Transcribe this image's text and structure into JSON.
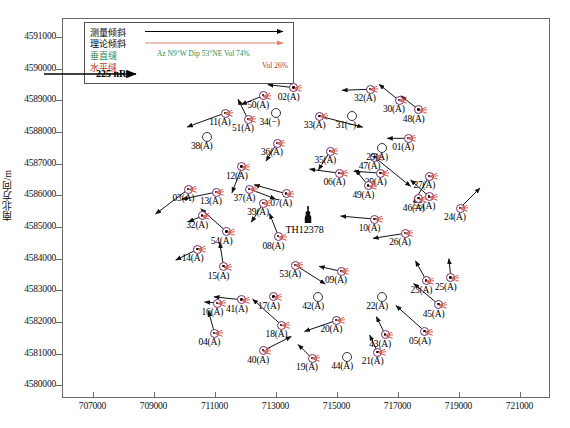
{
  "axes": {
    "ylabel": "南北方向/m",
    "xlabel": "",
    "xticks": [
      "707000",
      "709000",
      "711000",
      "713000",
      "715000",
      "717000",
      "719000",
      "721000"
    ],
    "yticks": [
      "4591000",
      "4590000",
      "4589000",
      "4588000",
      "4587000",
      "4586000",
      "4585000",
      "4584000",
      "4583000",
      "4582000",
      "4581000",
      "4580000"
    ],
    "xlim": [
      706000,
      722000
    ],
    "ylim": [
      4579600,
      4591600
    ]
  },
  "legend": {
    "measured_tilt": "测量倾斜",
    "theoretical_tilt": "理论倾斜",
    "vertical_fracture": "垂直缝",
    "horizontal_fracture": "水平缝",
    "vertical_params": "Az N9°W Dip 53°NE Vol 74%",
    "horizontal_params": "Vol 26%",
    "scale_label": "225 nR",
    "colors": {
      "measured": "#000000",
      "theoretical": "#e08070",
      "vertical": "#2e8b57",
      "horizontal": "#c0392b",
      "station_ring": "#7a2a6a"
    }
  },
  "well": {
    "label": "TH12378",
    "x": 714050,
    "y": 4585150
  },
  "chart_data": {
    "type": "scatter",
    "title": "",
    "xlabel": "",
    "ylabel": "南北方向/m",
    "xlim": [
      706000,
      722000
    ],
    "ylim": [
      4579600,
      4591600
    ],
    "grid": false,
    "legend_position": "top-left",
    "series": [
      {
        "name": "测量倾斜",
        "points": [
          {
            "label": "02(A)",
            "x": 713600,
            "y": 4589400,
            "type": "tilt",
            "dx": -26,
            "dy": -3
          },
          {
            "label": "50(A)",
            "x": 712600,
            "y": 4589150,
            "type": "tilt",
            "dx": -22,
            "dy": 9
          },
          {
            "label": "32(A)",
            "x": 716100,
            "y": 4589350,
            "type": "tilt",
            "dx": -28,
            "dy": 1
          },
          {
            "label": "30(A)",
            "x": 717050,
            "y": 4589000,
            "type": "tilt",
            "dx": -20,
            "dy": -16
          },
          {
            "label": "11(A)",
            "x": 711350,
            "y": 4588600,
            "type": "tilt",
            "dx": -38,
            "dy": 14
          },
          {
            "label": "51(A)",
            "x": 712100,
            "y": 4588400,
            "type": "tilt",
            "dx": -10,
            "dy": -20
          },
          {
            "label": "48(A)",
            "x": 717700,
            "y": 4588700,
            "type": "tilt",
            "dx": -18,
            "dy": -14
          },
          {
            "label": "33(A)",
            "x": 714450,
            "y": 4588500,
            "type": "tilt",
            "dx": 43,
            "dy": 11
          },
          {
            "label": "36(A)",
            "x": 713050,
            "y": 4587650,
            "type": "tilt",
            "dx": -11,
            "dy": 18
          },
          {
            "label": "35(A)",
            "x": 714800,
            "y": 4587400,
            "type": "tilt",
            "dx": -12,
            "dy": 19
          },
          {
            "label": "01(A)",
            "x": 717350,
            "y": 4587800,
            "type": "tilt",
            "dx": -21,
            "dy": 0
          },
          {
            "label": "47(A)",
            "x": 716250,
            "y": 4587200,
            "type": "tilt",
            "dx": 36,
            "dy": 29
          },
          {
            "label": "12(A)",
            "x": 711900,
            "y": 4586900,
            "type": "tilt",
            "dx": -10,
            "dy": 26
          },
          {
            "label": "06(A)",
            "x": 715100,
            "y": 4586700,
            "type": "tilt",
            "dx": -30,
            "dy": -4
          },
          {
            "label": "29(A)",
            "x": 716450,
            "y": 4586700,
            "type": "tilt",
            "dx": -27,
            "dy": -2
          },
          {
            "label": "27(A)",
            "x": 718050,
            "y": 4586600,
            "type": "tilt",
            "dx": -16,
            "dy": 26
          },
          {
            "label": "49(A)",
            "x": 716050,
            "y": 4586300,
            "type": "tilt",
            "dx": -13,
            "dy": -16
          },
          {
            "label": "03(A)",
            "x": 710150,
            "y": 4586200,
            "type": "tilt",
            "dx": -33,
            "dy": 25
          },
          {
            "label": "13(A)",
            "x": 711050,
            "y": 4586100,
            "type": "tilt",
            "dx": -34,
            "dy": 7
          },
          {
            "label": "37(A)",
            "x": 712150,
            "y": 4586200,
            "type": "tilt",
            "dx": 26,
            "dy": 10
          },
          {
            "label": "07(A)",
            "x": 713350,
            "y": 4586050,
            "type": "tilt",
            "dx": -32,
            "dy": -9
          },
          {
            "label": "55(A)",
            "x": 718050,
            "y": 4585950,
            "type": "tilt",
            "dx": -19,
            "dy": -17
          },
          {
            "label": "46(A)",
            "x": 717700,
            "y": 4585900,
            "type": "tilt",
            "dx": -2,
            "dy": -1
          },
          {
            "label": "24(A)",
            "x": 719050,
            "y": 4585600,
            "type": "tilt",
            "dx": 20,
            "dy": -20
          },
          {
            "label": "39(A)",
            "x": 712600,
            "y": 4585750,
            "type": "tilt",
            "dx": -12,
            "dy": 19
          },
          {
            "label": "32(A)",
            "x": 710600,
            "y": 4585350,
            "type": "tilt",
            "dx": -14,
            "dy": 6
          },
          {
            "label": "10(A)",
            "x": 716250,
            "y": 4585250,
            "type": "tilt",
            "dx": -34,
            "dy": -3
          },
          {
            "label": "54(A)",
            "x": 711400,
            "y": 4584850,
            "type": "tilt",
            "dx": -26,
            "dy": -23
          },
          {
            "label": "08(A)",
            "x": 713100,
            "y": 4584700,
            "type": "tilt",
            "dx": -9,
            "dy": -23
          },
          {
            "label": "26(A)",
            "x": 717250,
            "y": 4584800,
            "type": "tilt",
            "dx": -32,
            "dy": 5
          },
          {
            "label": "14(A)",
            "x": 710450,
            "y": 4584300,
            "type": "tilt",
            "dx": -22,
            "dy": 11
          },
          {
            "label": "15(A)",
            "x": 711300,
            "y": 4583750,
            "type": "tilt",
            "dx": -4,
            "dy": -24
          },
          {
            "label": "53(A)",
            "x": 713650,
            "y": 4583800,
            "type": "tilt",
            "dx": 30,
            "dy": 19
          },
          {
            "label": "09(A)",
            "x": 715150,
            "y": 4583600,
            "type": "tilt",
            "dx": -22,
            "dy": -5
          },
          {
            "label": "23(A)",
            "x": 717950,
            "y": 4583300,
            "type": "tilt",
            "dx": -11,
            "dy": -20
          },
          {
            "label": "25(A)",
            "x": 718750,
            "y": 4583400,
            "type": "tilt",
            "dx": -2,
            "dy": -19
          },
          {
            "label": "16(A)",
            "x": 711100,
            "y": 4582600,
            "type": "tilt",
            "dx": -13,
            "dy": -1
          },
          {
            "label": "41(A)",
            "x": 711900,
            "y": 4582700,
            "type": "tilt",
            "dx": -28,
            "dy": -3
          },
          {
            "label": "17(A)",
            "x": 712950,
            "y": 4582800,
            "type": "tilt",
            "dx": -1,
            "dy": -3
          },
          {
            "label": "45(A)",
            "x": 718350,
            "y": 4582550,
            "type": "tilt",
            "dx": -25,
            "dy": -21
          },
          {
            "label": "04(A)",
            "x": 711000,
            "y": 4581650,
            "type": "tilt",
            "dx": -6,
            "dy": -22
          },
          {
            "label": "18(A)",
            "x": 713200,
            "y": 4581900,
            "type": "tilt",
            "dx": -29,
            "dy": -26
          },
          {
            "label": "20(A)",
            "x": 715000,
            "y": 4582050,
            "type": "tilt",
            "dx": -32,
            "dy": 11
          },
          {
            "label": "43(A)",
            "x": 716600,
            "y": 4581600,
            "type": "tilt",
            "dx": -9,
            "dy": -18
          },
          {
            "label": "21(A)",
            "x": 716350,
            "y": 4581050,
            "type": "tilt",
            "dx": -8,
            "dy": -17
          },
          {
            "label": "05(A)",
            "x": 717900,
            "y": 4581700,
            "type": "tilt",
            "dx": -29,
            "dy": -26
          },
          {
            "label": "40(A)",
            "x": 712600,
            "y": 4581100,
            "type": "tilt",
            "dx": 28,
            "dy": -14
          },
          {
            "label": "19(A)",
            "x": 714200,
            "y": 4580850,
            "type": "tilt",
            "dx": -14,
            "dy": -14
          }
        ]
      },
      {
        "name": "无数据测点",
        "points": [
          {
            "label": "34(−)",
            "x": 713000,
            "y": 4588600,
            "type": "empty"
          },
          {
            "label": "31(−)",
            "x": 715500,
            "y": 4588500,
            "type": "empty"
          },
          {
            "label": "38(A)",
            "x": 710750,
            "y": 4587850,
            "type": "empty"
          },
          {
            "label": "29(A)",
            "x": 716500,
            "y": 4587500,
            "type": "empty"
          },
          {
            "label": "42(A)",
            "x": 714400,
            "y": 4582800,
            "type": "empty"
          },
          {
            "label": "22(A)",
            "x": 716500,
            "y": 4582800,
            "type": "empty"
          },
          {
            "label": "44(A)",
            "x": 715350,
            "y": 4580900,
            "type": "empty"
          }
        ]
      }
    ]
  }
}
